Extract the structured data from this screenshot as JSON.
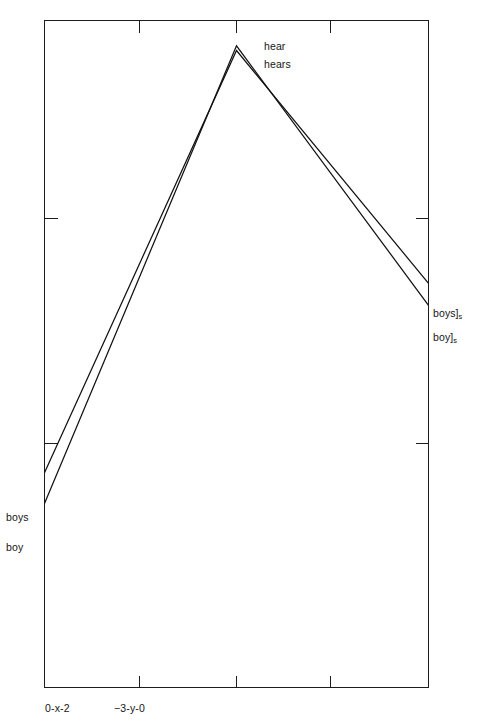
{
  "chart_data": {
    "type": "line",
    "title": "",
    "subtitle": "",
    "xlabel": "",
    "ylabel": "",
    "grid": false,
    "legend_position": "inline-annotations",
    "frame": "box",
    "xlim": [
      0,
      4
    ],
    "ylim": [
      0,
      10
    ],
    "x": [
      0,
      2,
      4
    ],
    "series": [
      {
        "name": "boys",
        "start_label": "boys",
        "peak_label": "hears",
        "end_label": "boys]s",
        "values": [
          3.22,
          9.55,
          6.06
        ]
      },
      {
        "name": "boy",
        "start_label": "boy",
        "peak_label": "hear",
        "end_label": "boy]s",
        "values": [
          2.76,
          9.62,
          5.73
        ]
      }
    ],
    "x_tick_positions": [
      0.98,
      1.98,
      2.94
    ],
    "x_tick_labels_shown": [
      "0-x-2",
      "−3-y-0"
    ],
    "y_tick_positions": [
      3.42,
      6.86
    ],
    "annotations": [
      {
        "text": "boys",
        "anchor": "left-axis-top-series"
      },
      {
        "text": "boy",
        "anchor": "left-axis-bottom-series"
      },
      {
        "text": "hear",
        "anchor": "peak-upper"
      },
      {
        "text": "hears",
        "anchor": "peak-lower"
      },
      {
        "text": "boys]s",
        "anchor": "right-axis-top-series"
      },
      {
        "text": "boy]s",
        "anchor": "right-axis-bottom-series"
      }
    ]
  },
  "labels": {
    "left_top": "boys",
    "left_bottom": "boy",
    "peak_top": "hear",
    "peak_bottom": "hears",
    "right_top_word": "boys]",
    "right_top_sub": "s",
    "right_bottom_word": "boy]",
    "right_bottom_sub": "s",
    "xtick_0": "0-x-2",
    "xtick_1": "−3-y-0"
  },
  "colors": {
    "line": "#121212",
    "axis": "#1c1c1c",
    "background": "#ffffff",
    "text": "#151515"
  }
}
